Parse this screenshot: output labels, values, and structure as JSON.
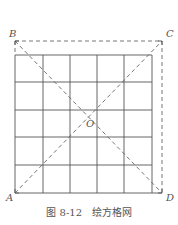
{
  "figure": {
    "caption": "图 8-12   绘方格网",
    "labels": {
      "A": "A",
      "B": "B",
      "C": "C",
      "D": "D",
      "O": "O"
    },
    "grid": {
      "columns": 5,
      "rows": 5,
      "x": [
        15,
        43,
        70,
        97,
        124,
        152
      ],
      "y": [
        55,
        82,
        110,
        137,
        165,
        193
      ]
    },
    "square": {
      "B": [
        15,
        41
      ],
      "C": [
        162,
        41
      ],
      "D": [
        162,
        193
      ],
      "A": [
        15,
        193
      ]
    },
    "center_O": [
      88,
      117
    ],
    "colors": {
      "grid": "#555555",
      "dashed": "#666666",
      "text": "#555555"
    }
  }
}
